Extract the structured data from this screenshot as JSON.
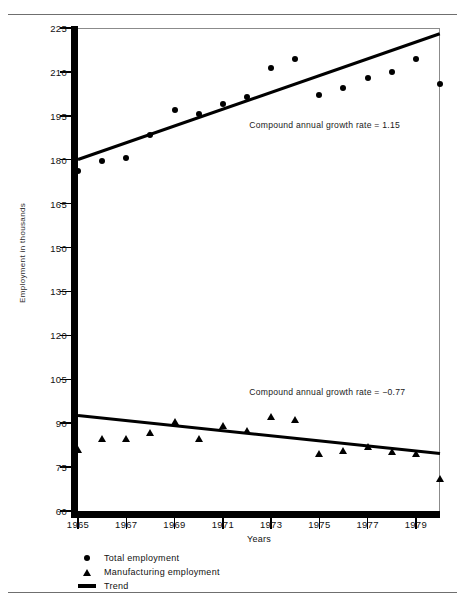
{
  "figure": {
    "truncated_caption_above": "",
    "y_axis_title": "Employment in thousands",
    "x_axis_title": "Years"
  },
  "legend": {
    "items": [
      {
        "marker": "dot-marker",
        "label": "Total employment"
      },
      {
        "marker": "triangle-marker",
        "label": "Manufacturing employment"
      },
      {
        "marker": "line-marker",
        "label": "Trend"
      }
    ]
  },
  "annotations": [
    {
      "id": "total-growth-note",
      "text": "Compound annual growth rate  =  1.15"
    },
    {
      "id": "manufacturing-growth-note",
      "text": "Compound annual growth rate  =  −0.77"
    }
  ],
  "chart_data": {
    "type": "scatter",
    "title": "",
    "xlabel": "Years",
    "ylabel": "Employment in thousands",
    "xlim": [
      1965,
      1980
    ],
    "ylim": [
      60,
      225
    ],
    "yticks": [
      225,
      210,
      195,
      180,
      165,
      150,
      135,
      120,
      105,
      90,
      75,
      60
    ],
    "xticks": [
      1965,
      1967,
      1969,
      1971,
      1973,
      1975,
      1977,
      1979
    ],
    "grid": false,
    "legend_position": "below-axes-left",
    "x": [
      1965,
      1966,
      1967,
      1968,
      1969,
      1970,
      1971,
      1972,
      1973,
      1974,
      1975,
      1976,
      1977,
      1978,
      1979,
      1980
    ],
    "series": [
      {
        "name": "Total employment",
        "marker": "circle",
        "values": [
          176.0,
          179.5,
          180.5,
          188.5,
          197.0,
          195.5,
          199.0,
          201.5,
          211.5,
          214.5,
          202.0,
          204.5,
          208.0,
          210.0,
          214.5,
          206.0
        ]
      },
      {
        "name": "Manufacturing employment",
        "marker": "triangle",
        "values": [
          81.0,
          84.5,
          84.5,
          86.5,
          90.5,
          84.5,
          89.0,
          87.5,
          92.0,
          91.0,
          79.5,
          80.5,
          82.0,
          80.0,
          79.5,
          71.0
        ]
      }
    ],
    "trend_lines": [
      {
        "name": "Total employment trend",
        "x": [
          1965,
          1980
        ],
        "y": [
          180.0,
          223.0
        ],
        "growth_rate": 1.15
      },
      {
        "name": "Manufacturing employment trend",
        "x": [
          1965,
          1980
        ],
        "y": [
          92.5,
          79.5
        ],
        "growth_rate": -0.77
      }
    ]
  }
}
